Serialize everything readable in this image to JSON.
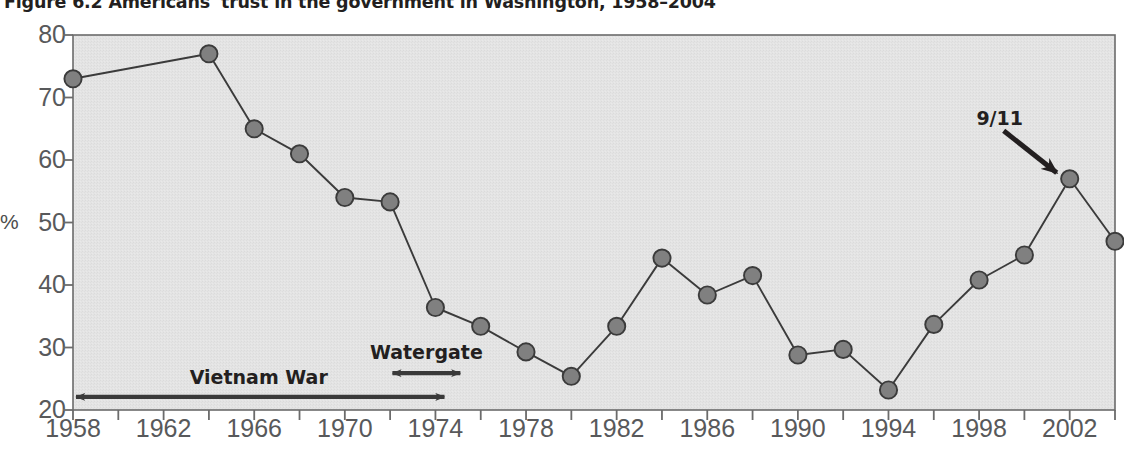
{
  "figure": {
    "title": "Figure 6.2  Americans' trust in the government in Washington, 1958–2004"
  },
  "chart_data": {
    "type": "line",
    "title": "Figure 6.2  Americans' trust in the government in Washington, 1958–2004",
    "xlabel": "",
    "ylabel": "%",
    "xlim": [
      1958,
      2004
    ],
    "ylim": [
      20,
      80
    ],
    "yticks": [
      20,
      30,
      40,
      50,
      60,
      70,
      80
    ],
    "ytick_labels": [
      "20",
      "30",
      "40",
      "50",
      "60",
      "70",
      "80"
    ],
    "xticks": [
      1958,
      1962,
      1966,
      1970,
      1974,
      1978,
      1982,
      1986,
      1990,
      1994,
      1998,
      2002
    ],
    "xtick_labels": [
      "1958",
      "1962",
      "1966",
      "1970",
      "1974",
      "1978",
      "1982",
      "1986",
      "1990",
      "1994",
      "1998",
      "2002"
    ],
    "minor_xtick_interval": 2,
    "grid": false,
    "legend": "none",
    "plot_background": "#e3e3e3",
    "marker_color": "#808080",
    "marker_edge_color": "#3b3b3b",
    "line_color": "#3b3b3b",
    "x": [
      1958,
      1964,
      1966,
      1968,
      1970,
      1972,
      1974,
      1976,
      1978,
      1980,
      1982,
      1984,
      1986,
      1988,
      1990,
      1992,
      1994,
      1996,
      1998,
      2000,
      2002,
      2004
    ],
    "values": [
      73,
      77,
      65,
      61,
      54,
      53.3,
      36.4,
      33.4,
      29.3,
      25.4,
      33.4,
      44.3,
      38.4,
      41.5,
      28.8,
      29.7,
      23.2,
      33.7,
      40.8,
      44.8,
      57,
      47
    ],
    "series": [
      {
        "name": "Trust in government",
        "values": [
          73,
          77,
          65,
          61,
          54,
          53.3,
          36.4,
          33.4,
          29.3,
          25.4,
          33.4,
          44.3,
          38.4,
          41.5,
          28.8,
          29.7,
          23.2,
          33.7,
          40.8,
          44.8,
          57,
          47
        ]
      }
    ],
    "annotations": [
      {
        "label": "Vietnam War",
        "type": "double-arrow-span",
        "x_start": 1958,
        "x_end": 1974.4,
        "y": 22.1
      },
      {
        "label": "Watergate",
        "type": "double-arrow-span",
        "x_start": 1972.1,
        "x_end": 1975.1,
        "y": 25.9
      },
      {
        "label": "9/11",
        "type": "arrow-pointer",
        "target_x": 2002,
        "target_y": 57
      }
    ]
  }
}
